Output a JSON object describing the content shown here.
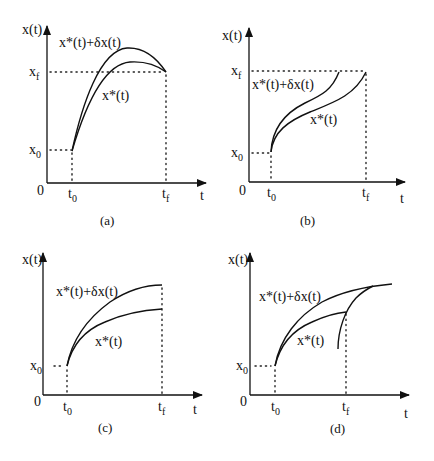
{
  "figure": {
    "panels": [
      {
        "id": "a",
        "caption": "(a)",
        "y_axis_label": "x(t)",
        "x_axis_label": "t",
        "origin_label": "0",
        "x0_label": "x",
        "x0_sub": "0",
        "xf_label": "x",
        "xf_sub": "f",
        "t0_label": "t",
        "t0_sub": "0",
        "tf_label": "t",
        "tf_sub": "f",
        "upper_curve_label": "x*(t)+δx(t)",
        "lower_curve_label": "x*(t)",
        "description": "Fixed final time and fixed final state"
      },
      {
        "id": "b",
        "caption": "(b)",
        "y_axis_label": "x(t)",
        "x_axis_label": "t",
        "origin_label": "0",
        "x0_label": "x",
        "x0_sub": "0",
        "xf_label": "x",
        "xf_sub": "f",
        "t0_label": "t",
        "t0_sub": "0",
        "tf_label": "t",
        "tf_sub": "f",
        "upper_curve_label": "x*(t)+δx(t)",
        "lower_curve_label": "x*(t)",
        "description": "Free final time and fixed final state"
      },
      {
        "id": "c",
        "caption": "(c)",
        "y_axis_label": "x(t)",
        "x_axis_label": "t",
        "origin_label": "0",
        "x0_label": "x",
        "x0_sub": "0",
        "t0_label": "t",
        "t0_sub": "0",
        "tf_label": "t",
        "tf_sub": "f",
        "upper_curve_label": "x*(t)+δx(t)",
        "lower_curve_label": "x*(t)",
        "description": "Fixed final time and free final state"
      },
      {
        "id": "d",
        "caption": "(d)",
        "y_axis_label": "x(t)",
        "x_axis_label": "t",
        "origin_label": "0",
        "x0_label": "x",
        "x0_sub": "0",
        "t0_label": "t",
        "t0_sub": "0",
        "tf_label": "t",
        "tf_sub": "f",
        "upper_curve_label": "x*(t)+δx(t)",
        "lower_curve_label": "x*(t)",
        "description": "Free final time, final state on a terminal curve"
      }
    ]
  }
}
